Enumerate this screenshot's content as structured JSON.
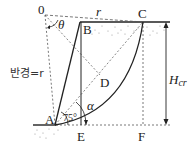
{
  "diagram": {
    "type": "slope-stability-circular-failure",
    "points": {
      "O": "0",
      "A": "A",
      "B": "B",
      "C": "C",
      "D": "D",
      "E": "E",
      "F": "F"
    },
    "labels": {
      "radius_top": "r",
      "theta": "θ",
      "radius_side": "반경=r",
      "angle_slope": "75°",
      "alpha": "α",
      "height_main": "H",
      "height_sub": "cr"
    },
    "colors": {
      "line": "#222222",
      "dashed": "#555555",
      "soil_dots": "#888888",
      "background": "#ffffff"
    }
  }
}
